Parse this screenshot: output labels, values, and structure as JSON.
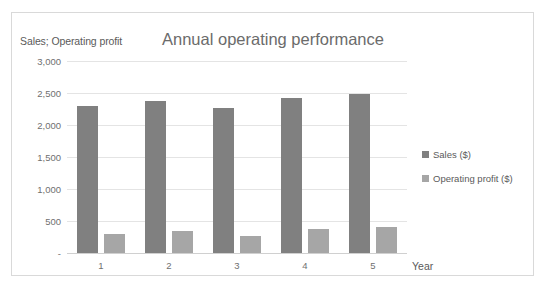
{
  "chart_data": {
    "type": "bar",
    "title": "Annual operating performance",
    "xlabel": "Year",
    "ylabel": "Sales; Operating profit",
    "categories": [
      "1",
      "2",
      "3",
      "4",
      "5"
    ],
    "series": [
      {
        "name": "Sales ($)",
        "color": "#808080",
        "values": [
          2300,
          2370,
          2260,
          2420,
          2480
        ]
      },
      {
        "name": "Operating profit ($)",
        "color": "#a6a6a6",
        "values": [
          300,
          340,
          260,
          380,
          410
        ]
      }
    ],
    "ylim": [
      0,
      3000
    ],
    "ytick_values": [
      3000,
      2500,
      2000,
      1500,
      1000,
      500,
      0
    ],
    "ytick_labels": [
      "3,000",
      "2,500",
      "2,000",
      "1,500",
      "1,000",
      "500",
      "-"
    ],
    "grid": true,
    "legend_position": "right"
  },
  "legend": {
    "items": [
      {
        "label": "Sales ($)",
        "marker": "square-marker"
      },
      {
        "label": "Operating profit ($)",
        "marker": "square-marker"
      }
    ]
  }
}
